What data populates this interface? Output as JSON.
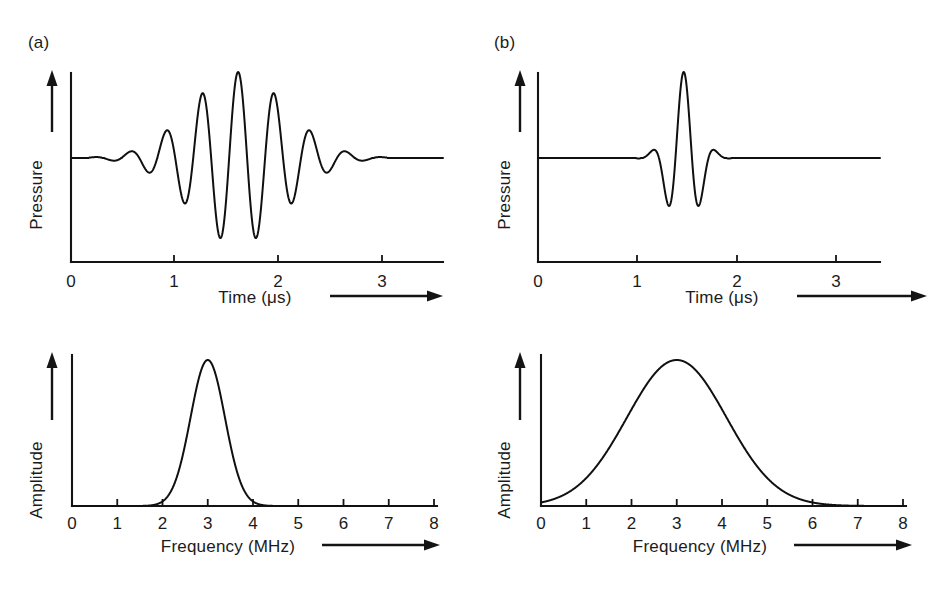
{
  "figure": {
    "background": "#ffffff",
    "ink_color": "#141414",
    "panels": [
      {
        "id": "a-waveform",
        "label": "(a)",
        "kind": "waveform",
        "x_axis_title": "Time (μs)",
        "y_axis_title": "Pressure",
        "x_ticks": [
          "0",
          "1",
          "2",
          "3"
        ],
        "y_ticks": [],
        "has_axis_arrow_x": true,
        "has_axis_arrow_y": true
      },
      {
        "id": "b-waveform",
        "label": "(b)",
        "kind": "waveform",
        "x_axis_title": "Time (μs)",
        "y_axis_title": "Pressure",
        "x_ticks": [
          "0",
          "1",
          "2",
          "3"
        ],
        "y_ticks": [],
        "has_axis_arrow_x": true,
        "has_axis_arrow_y": true
      },
      {
        "id": "a-spectrum",
        "label": "",
        "kind": "spectrum",
        "x_axis_title": "Frequency (MHz)",
        "y_axis_title": "Amplitude",
        "x_ticks": [
          "0",
          "1",
          "2",
          "3",
          "4",
          "5",
          "6",
          "7",
          "8"
        ],
        "y_ticks": [],
        "has_axis_arrow_x": true,
        "has_axis_arrow_y": true
      },
      {
        "id": "b-spectrum",
        "label": "",
        "kind": "spectrum",
        "x_axis_title": "Frequency (MHz)",
        "y_axis_title": "Amplitude",
        "x_ticks": [
          "0",
          "1",
          "2",
          "3",
          "4",
          "5",
          "6",
          "7",
          "8"
        ],
        "y_ticks": [],
        "has_axis_arrow_x": true,
        "has_axis_arrow_y": true
      }
    ]
  },
  "chart_data": [
    {
      "id": "a-waveform",
      "type": "line",
      "title": "(a) Long narrow-band ultrasound pulse",
      "xlabel": "Time (μs)",
      "ylabel": "Pressure",
      "xlim": [
        0,
        3.45
      ],
      "ylim": [
        -1.15,
        1.15
      ],
      "xticks": [
        0,
        1,
        2,
        3
      ],
      "xticklabels": [
        "0",
        "1",
        "2",
        "3"
      ],
      "yticks": [],
      "grid": false,
      "legend": "none",
      "model": {
        "form": "gaussian-enveloped sinusoid",
        "center_us": 1.55,
        "envelope_sigma_us": 0.44,
        "frequency_mhz": 3.0,
        "phase_rad": 1.5707963,
        "peak_amplitude": 1.0,
        "baseline": 0.0,
        "cycles_visible": 9
      },
      "annotations": [
        "narrow bandwidth",
        "many cycles",
        "long pulse length"
      ]
    },
    {
      "id": "b-waveform",
      "type": "line",
      "title": "(b) Short broad-band ultrasound pulse",
      "xlabel": "Time (μs)",
      "ylabel": "Pressure",
      "xlim": [
        0,
        3.45
      ],
      "ylim": [
        -1.15,
        1.15
      ],
      "xticks": [
        0,
        1,
        2,
        3
      ],
      "xticklabels": [
        "0",
        "1",
        "2",
        "3"
      ],
      "yticks": [],
      "grid": false,
      "legend": "none",
      "model": {
        "form": "gaussian-enveloped sinusoid",
        "center_us": 1.47,
        "envelope_sigma_us": 0.145,
        "frequency_mhz": 3.0,
        "phase_rad": 1.5707963,
        "peak_amplitude": 1.0,
        "baseline": 0.0,
        "cycles_visible": 2
      },
      "annotations": [
        "broad bandwidth",
        "few cycles",
        "short pulse length"
      ]
    },
    {
      "id": "a-spectrum",
      "type": "line",
      "title": "Frequency spectrum of pulse (a)",
      "xlabel": "Frequency (MHz)",
      "ylabel": "Amplitude",
      "xlim": [
        0,
        8
      ],
      "ylim": [
        0,
        1.1
      ],
      "xticks": [
        0,
        1,
        2,
        3,
        4,
        5,
        6,
        7,
        8
      ],
      "xticklabels": [
        "0",
        "1",
        "2",
        "3",
        "4",
        "5",
        "6",
        "7",
        "8"
      ],
      "yticks": [],
      "grid": false,
      "legend": "none",
      "model": {
        "form": "gaussian",
        "center_mhz": 3.0,
        "sigma_mhz": 0.38,
        "peak_amplitude": 1.0,
        "fwhm_mhz": 0.9,
        "bandwidth": "narrow"
      },
      "x": [
        0,
        0.5,
        1,
        1.5,
        2,
        2.2,
        2.4,
        2.6,
        2.8,
        3.0,
        3.2,
        3.4,
        3.6,
        3.8,
        4.0,
        4.5,
        5,
        6,
        7,
        8
      ],
      "y": [
        0.0,
        0.0,
        0.0,
        0.0,
        0.03,
        0.08,
        0.21,
        0.45,
        0.74,
        1.0,
        0.74,
        0.45,
        0.21,
        0.08,
        0.03,
        0.0,
        0.0,
        0.0,
        0.0,
        0.0
      ]
    },
    {
      "id": "b-spectrum",
      "type": "line",
      "title": "Frequency spectrum of pulse (b)",
      "xlabel": "Frequency (MHz)",
      "ylabel": "Amplitude",
      "xlim": [
        0,
        8
      ],
      "ylim": [
        0,
        1.1
      ],
      "xticks": [
        0,
        1,
        2,
        3,
        4,
        5,
        6,
        7,
        8
      ],
      "xticklabels": [
        "0",
        "1",
        "2",
        "3",
        "4",
        "5",
        "6",
        "7",
        "8"
      ],
      "yticks": [],
      "grid": false,
      "legend": "none",
      "model": {
        "form": "gaussian",
        "center_mhz": 3.0,
        "sigma_mhz": 1.1,
        "peak_amplitude": 1.0,
        "fwhm_mhz": 2.6,
        "bandwidth": "broad"
      },
      "x": [
        0,
        0.5,
        1,
        1.5,
        2,
        2.5,
        3.0,
        3.5,
        4,
        4.5,
        5,
        5.5,
        6,
        6.5,
        7,
        7.5,
        8
      ],
      "y": [
        0.02,
        0.05,
        0.13,
        0.28,
        0.49,
        0.75,
        1.0,
        0.91,
        0.7,
        0.45,
        0.25,
        0.11,
        0.04,
        0.01,
        0.0,
        0.0,
        0.0
      ]
    }
  ]
}
